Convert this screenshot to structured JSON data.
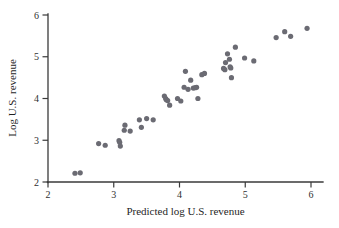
{
  "chart_data": {
    "type": "scatter",
    "title": "",
    "xlabel": "Predicted log U.S. revenue",
    "ylabel": "Log U.S. revenue",
    "xlim": [
      2,
      6
    ],
    "ylim": [
      2,
      6
    ],
    "xticks": [
      2,
      3,
      4,
      5,
      6
    ],
    "yticks": [
      2,
      3,
      4,
      5,
      6
    ],
    "xtick_labels": [
      "2",
      "3",
      "4",
      "5",
      "6"
    ],
    "ytick_labels": [
      "2",
      "3",
      "4",
      "5",
      "6"
    ],
    "grid": false,
    "legend": null,
    "marker": {
      "shape": "circle",
      "color": "#6b6b73",
      "size": 2.6
    },
    "series": [
      {
        "name": "observations",
        "points": [
          [
            2.41,
            2.21
          ],
          [
            2.49,
            2.22
          ],
          [
            2.77,
            2.92
          ],
          [
            2.87,
            2.88
          ],
          [
            3.08,
            2.99
          ],
          [
            3.09,
            2.95
          ],
          [
            3.1,
            2.86
          ],
          [
            3.16,
            3.24
          ],
          [
            3.17,
            3.36
          ],
          [
            3.25,
            3.22
          ],
          [
            3.39,
            3.49
          ],
          [
            3.42,
            3.31
          ],
          [
            3.5,
            3.52
          ],
          [
            3.6,
            3.49
          ],
          [
            3.77,
            4.06
          ],
          [
            3.79,
            4.0
          ],
          [
            3.8,
            3.97
          ],
          [
            3.82,
            3.95
          ],
          [
            3.85,
            3.84
          ],
          [
            3.97,
            4.0
          ],
          [
            4.02,
            3.94
          ],
          [
            4.07,
            4.27
          ],
          [
            4.09,
            4.65
          ],
          [
            4.13,
            4.22
          ],
          [
            4.17,
            4.44
          ],
          [
            4.21,
            4.25
          ],
          [
            4.24,
            4.26
          ],
          [
            4.26,
            4.27
          ],
          [
            4.28,
            4.0
          ],
          [
            4.34,
            4.57
          ],
          [
            4.38,
            4.6
          ],
          [
            4.67,
            4.72
          ],
          [
            4.69,
            4.69
          ],
          [
            4.7,
            4.86
          ],
          [
            4.73,
            5.07
          ],
          [
            4.76,
            4.94
          ],
          [
            4.77,
            4.76
          ],
          [
            4.78,
            4.73
          ],
          [
            4.79,
            4.5
          ],
          [
            4.85,
            5.23
          ],
          [
            4.99,
            4.97
          ],
          [
            5.13,
            4.9
          ],
          [
            5.47,
            5.46
          ],
          [
            5.6,
            5.6
          ],
          [
            5.69,
            5.49
          ],
          [
            5.94,
            5.68
          ]
        ]
      }
    ]
  },
  "figure": {
    "x_axis_title": "Predicted log U.S. revenue",
    "y_axis_title": "Log U.S. revenue",
    "x_tick_labels": [
      "2",
      "3",
      "4",
      "5",
      "6"
    ],
    "y_tick_labels": [
      "2",
      "3",
      "4",
      "5",
      "6"
    ],
    "background_color": "#ffffff",
    "axis_color": "#3a3a3a",
    "point_color": "#6b6b73"
  }
}
